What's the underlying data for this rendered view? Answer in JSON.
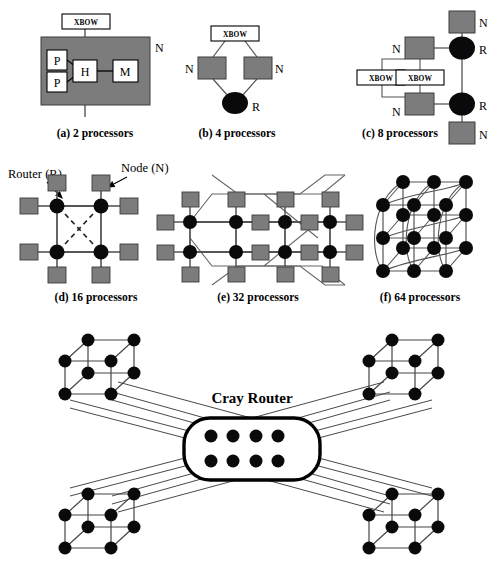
{
  "figure": {
    "colors": {
      "node_fill": "#7c7c7c",
      "node_stroke": "#3d3d3d",
      "router_fill": "#0a0a0a",
      "line": "#555555",
      "dark_line": "#1a1a1a",
      "box_fill": "#ffffff",
      "box_stroke": "#000000",
      "background": "#ffffff"
    },
    "legend": {
      "router_label": "Router (R)",
      "node_label": "Node (N)"
    },
    "panels": [
      {
        "id": "a",
        "caption": "(a) 2 processors",
        "xbow_label": "XBOW",
        "node_marker": "N",
        "inner_boxes": [
          "P",
          "P",
          "H",
          "M"
        ],
        "processors": 2,
        "routers": 0,
        "nodes": 1
      },
      {
        "id": "b",
        "caption": "(b) 4 processors",
        "xbow_label": "XBOW",
        "node_markers": [
          "N",
          "N"
        ],
        "router_marker": "R",
        "processors": 4,
        "routers": 1,
        "nodes": 2
      },
      {
        "id": "c",
        "caption": "(c) 8 processors",
        "xbow_labels": [
          "XBOW",
          "XBOW"
        ],
        "node_markers": [
          "N",
          "N",
          "N",
          "N"
        ],
        "router_markers": [
          "R",
          "R"
        ],
        "processors": 8,
        "routers": 2,
        "nodes": 4
      },
      {
        "id": "d",
        "caption": "(d) 16 processors",
        "processors": 16,
        "routers": 4,
        "nodes": 8,
        "topology": "2x2 router mesh with dashed express links"
      },
      {
        "id": "e",
        "caption": "(e) 32 processors",
        "processors": 32,
        "routers": 8,
        "nodes": 16,
        "topology": "4x2 torus with wrap-around links"
      },
      {
        "id": "f",
        "caption": "(f) 64 processors",
        "processors": 64,
        "routers": 16,
        "nodes": 0,
        "topology": "4x2x2 three-dimensional torus"
      }
    ],
    "bottom": {
      "cray_router_label": "Cray Router",
      "cluster_count": 4,
      "router_dot_rows": 2,
      "router_dot_cols": 4,
      "router_dot_total": 8,
      "cluster_nodes_each": 8
    }
  }
}
